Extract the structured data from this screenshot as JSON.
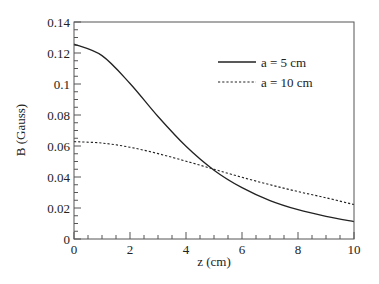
{
  "chart_data": {
    "type": "line",
    "title": "",
    "xlabel": "z (cm)",
    "ylabel": "B (Gauss)",
    "xlim": [
      0,
      10
    ],
    "ylim": [
      0,
      0.14
    ],
    "xticks": [
      "0",
      "2",
      "4",
      "6",
      "8",
      "10"
    ],
    "yticks": [
      "0",
      "0.02",
      "0.04",
      "0.06",
      "0.08",
      "0.1",
      "0.12",
      "0.14"
    ],
    "grid": false,
    "legend_position": "upper right",
    "x": [
      0,
      1,
      2,
      3,
      4,
      5,
      6,
      7,
      8,
      9,
      10
    ],
    "series": [
      {
        "name": "a = 5 cm",
        "style": "solid",
        "values": [
          0.1257,
          0.1183,
          0.1003,
          0.079,
          0.0598,
          0.0444,
          0.0331,
          0.0248,
          0.0189,
          0.0146,
          0.0112
        ]
      },
      {
        "name": "a = 10 cm",
        "style": "dotted",
        "values": [
          0.0628,
          0.0619,
          0.0592,
          0.0551,
          0.0502,
          0.045,
          0.0398,
          0.035,
          0.0306,
          0.0266,
          0.0222
        ]
      }
    ]
  }
}
